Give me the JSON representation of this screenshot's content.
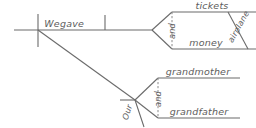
{
  "diagram": {
    "type": "reed-kellogg-sentence-diagram",
    "sentence": "We gave our grandmother and grandfather tickets and airplane money",
    "line_color": "#6b6b6b",
    "text_color": "#5d5d5d",
    "background": "#ffffff",
    "words": {
      "subject": "We",
      "verb": "gave",
      "direct_object_1": "tickets",
      "direct_object_2": "money",
      "direct_object_conjunction": "and",
      "direct_object_2_modifier": "airplane",
      "indirect_object_1": "grandmother",
      "indirect_object_2": "grandfather",
      "indirect_object_conjunction": "and",
      "indirect_object_preposition": "Our"
    }
  }
}
